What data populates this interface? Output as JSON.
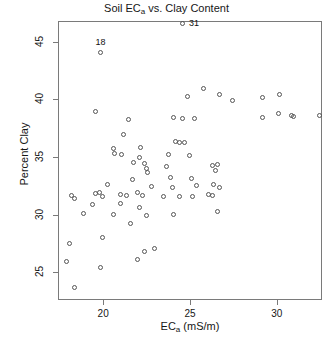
{
  "chart_data": {
    "type": "scatter",
    "title": "Soil ECa vs. Clay Content",
    "title_main": "Soil EC",
    "title_sub": "a",
    "title_rest": " vs. Clay Content",
    "xlabel": "ECa (mS/m)",
    "xlabel_main": "EC",
    "xlabel_sub": "a",
    "xlabel_rest": " (mS/m)",
    "ylabel": "Percent Clay",
    "xlim": [
      17.4,
      32.6
    ],
    "ylim": [
      22.6,
      46.8
    ],
    "xticks": [
      20,
      25,
      30
    ],
    "xticklabels": [
      "20",
      "25",
      "30"
    ],
    "yticks": [
      25,
      30,
      35,
      40,
      45
    ],
    "yticklabels": [
      "25",
      "30",
      "35",
      "40",
      "45"
    ],
    "grid": false,
    "legend": null,
    "marker": "open-circle",
    "annotations": [
      {
        "text": "18",
        "x": 19.9,
        "y": 44.0,
        "position": "above"
      },
      {
        "text": "31",
        "x": 24.6,
        "y": 46.5,
        "position": "right"
      }
    ],
    "points": [
      {
        "x": 24.6,
        "y": 46.5
      },
      {
        "x": 19.9,
        "y": 44.0
      },
      {
        "x": 25.8,
        "y": 40.9
      },
      {
        "x": 24.9,
        "y": 40.2
      },
      {
        "x": 26.7,
        "y": 40.4
      },
      {
        "x": 27.5,
        "y": 39.9
      },
      {
        "x": 29.2,
        "y": 40.1
      },
      {
        "x": 30.2,
        "y": 40.4
      },
      {
        "x": 32.5,
        "y": 38.6
      },
      {
        "x": 19.6,
        "y": 38.9
      },
      {
        "x": 21.5,
        "y": 38.2
      },
      {
        "x": 24.6,
        "y": 38.3
      },
      {
        "x": 25.3,
        "y": 38.3
      },
      {
        "x": 24.1,
        "y": 38.4
      },
      {
        "x": 29.2,
        "y": 38.4
      },
      {
        "x": 30.1,
        "y": 38.7
      },
      {
        "x": 30.9,
        "y": 38.6
      },
      {
        "x": 31.0,
        "y": 38.5
      },
      {
        "x": 21.2,
        "y": 36.9
      },
      {
        "x": 20.6,
        "y": 35.7
      },
      {
        "x": 20.7,
        "y": 35.3
      },
      {
        "x": 21.1,
        "y": 35.2
      },
      {
        "x": 24.2,
        "y": 36.3
      },
      {
        "x": 24.4,
        "y": 36.2
      },
      {
        "x": 24.7,
        "y": 36.2
      },
      {
        "x": 23.8,
        "y": 35.2
      },
      {
        "x": 25.0,
        "y": 35.1
      },
      {
        "x": 22.2,
        "y": 35.8
      },
      {
        "x": 22.1,
        "y": 34.9
      },
      {
        "x": 21.8,
        "y": 34.5
      },
      {
        "x": 22.4,
        "y": 34.4
      },
      {
        "x": 22.5,
        "y": 34.0
      },
      {
        "x": 22.6,
        "y": 33.6
      },
      {
        "x": 23.7,
        "y": 34.1
      },
      {
        "x": 26.3,
        "y": 34.2
      },
      {
        "x": 26.6,
        "y": 34.3
      },
      {
        "x": 26.5,
        "y": 33.8
      },
      {
        "x": 23.9,
        "y": 33.2
      },
      {
        "x": 25.1,
        "y": 33.1
      },
      {
        "x": 21.7,
        "y": 33.0
      },
      {
        "x": 20.3,
        "y": 32.6
      },
      {
        "x": 22.8,
        "y": 32.4
      },
      {
        "x": 24.0,
        "y": 32.3
      },
      {
        "x": 25.4,
        "y": 32.5
      },
      {
        "x": 26.4,
        "y": 32.6
      },
      {
        "x": 26.7,
        "y": 32.3
      },
      {
        "x": 18.2,
        "y": 31.6
      },
      {
        "x": 18.4,
        "y": 31.4
      },
      {
        "x": 19.6,
        "y": 31.8
      },
      {
        "x": 19.8,
        "y": 31.9
      },
      {
        "x": 20.0,
        "y": 31.5
      },
      {
        "x": 21.0,
        "y": 31.7
      },
      {
        "x": 21.4,
        "y": 31.6
      },
      {
        "x": 22.0,
        "y": 31.9
      },
      {
        "x": 22.3,
        "y": 31.6
      },
      {
        "x": 23.5,
        "y": 31.5
      },
      {
        "x": 24.4,
        "y": 31.5
      },
      {
        "x": 25.2,
        "y": 31.5
      },
      {
        "x": 26.1,
        "y": 31.7
      },
      {
        "x": 26.3,
        "y": 31.6
      },
      {
        "x": 19.4,
        "y": 30.8
      },
      {
        "x": 21.0,
        "y": 30.9
      },
      {
        "x": 22.1,
        "y": 30.6
      },
      {
        "x": 18.9,
        "y": 30.1
      },
      {
        "x": 20.6,
        "y": 30.0
      },
      {
        "x": 22.5,
        "y": 29.9
      },
      {
        "x": 24.1,
        "y": 30.0
      },
      {
        "x": 26.6,
        "y": 30.2
      },
      {
        "x": 21.6,
        "y": 29.2
      },
      {
        "x": 20.0,
        "y": 28.0
      },
      {
        "x": 18.1,
        "y": 27.5
      },
      {
        "x": 22.4,
        "y": 26.8
      },
      {
        "x": 23.0,
        "y": 27.0
      },
      {
        "x": 22.0,
        "y": 26.1
      },
      {
        "x": 17.9,
        "y": 25.9
      },
      {
        "x": 19.9,
        "y": 25.4
      },
      {
        "x": 18.4,
        "y": 23.6
      }
    ]
  }
}
